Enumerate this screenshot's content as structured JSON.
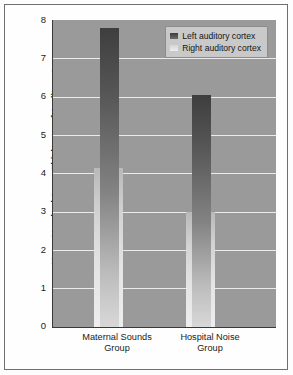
{
  "chart_data": {
    "type": "bar",
    "title": "",
    "xlabel": "",
    "ylabel": "Mean Standard Score Thickness of Auditory Areas",
    "ylim": [
      0,
      8
    ],
    "yticks": [
      "0",
      "1",
      "2",
      "3",
      "4",
      "5",
      "6",
      "7",
      "8"
    ],
    "grid": true,
    "legend_position": "top-right",
    "categories": [
      "Maternal Sounds Group",
      "Hospital Noise Group"
    ],
    "category_lines": [
      [
        "Maternal Sounds",
        "Group"
      ],
      [
        "Hospital Noise",
        "Group"
      ]
    ],
    "series": [
      {
        "name": "Left auditory cortex",
        "color": "#4a4a4a",
        "values": [
          7.8,
          6.05
        ]
      },
      {
        "name": "Right auditory cortex",
        "color": "#dcdcdc",
        "values": [
          4.15,
          3.0
        ]
      }
    ]
  },
  "legend": {
    "items": [
      {
        "label": "Left auditory cortex"
      },
      {
        "label": "Right auditory cortex"
      }
    ]
  },
  "colors": {
    "plot_background": "#9a9a9a",
    "gridline": "#efefef",
    "axis": "#3a3a3a",
    "page_background": "#ffffff",
    "legend_background": "#c9c9c9"
  }
}
